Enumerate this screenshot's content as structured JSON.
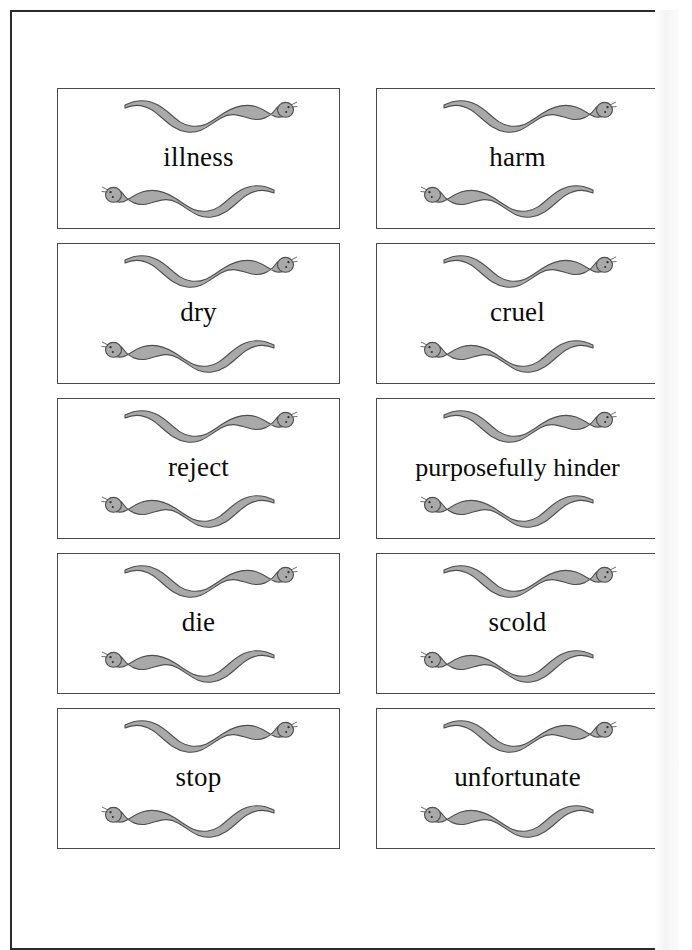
{
  "page": {
    "kind": "scanned-worksheet-page",
    "background_color": "#ffffff",
    "border_color": "#2b2b2b"
  },
  "artwork": {
    "motif_name": "worm-illustration",
    "body_fill": "#a9a9a9",
    "body_stroke": "#4f4f4f",
    "description_top": "worm facing right",
    "description_bottom": "worm facing left"
  },
  "cards": [
    {
      "id": "card-illness",
      "label": "illness",
      "column": "left",
      "row": 1
    },
    {
      "id": "card-harm",
      "label": "harm",
      "column": "right",
      "row": 1
    },
    {
      "id": "card-dry",
      "label": "dry",
      "column": "left",
      "row": 2
    },
    {
      "id": "card-cruel",
      "label": "cruel",
      "column": "right",
      "row": 2
    },
    {
      "id": "card-reject",
      "label": "reject",
      "column": "left",
      "row": 3
    },
    {
      "id": "card-purposefully-hinder",
      "label": "purposefully hinder",
      "column": "right",
      "row": 3
    },
    {
      "id": "card-die",
      "label": "die",
      "column": "left",
      "row": 4
    },
    {
      "id": "card-scold",
      "label": "scold",
      "column": "right",
      "row": 4
    },
    {
      "id": "card-stop",
      "label": "stop",
      "column": "left",
      "row": 5
    },
    {
      "id": "card-unfortunate",
      "label": "unfortunate",
      "column": "right",
      "row": 5
    }
  ]
}
